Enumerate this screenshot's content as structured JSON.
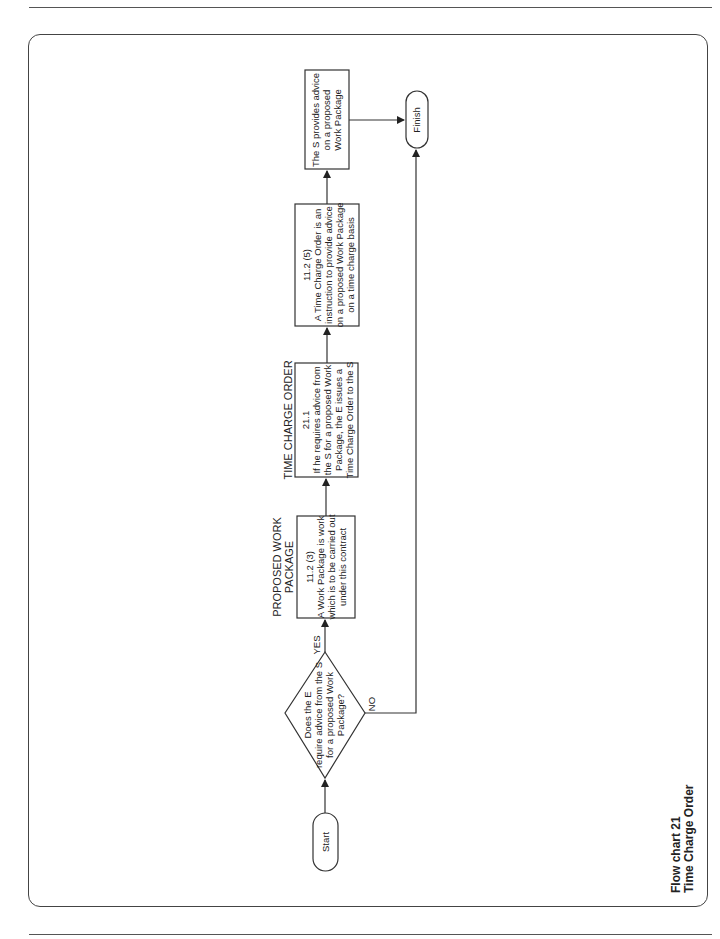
{
  "caption": {
    "line1": "Flow chart 21",
    "line2": "Time Charge Order"
  },
  "nodes": {
    "start": {
      "label": "Start"
    },
    "decision": {
      "lines": [
        "Does the E",
        "require advice from the S",
        "for a proposed Work",
        "Package?"
      ]
    },
    "yes_label": "YES",
    "no_label": "NO",
    "box1": {
      "heading": [
        "PROPOSED WORK",
        "PACKAGE"
      ],
      "lines": [
        "11.2 (3)",
        "A Work Package is work",
        "which is to be carried out",
        "under this contract"
      ]
    },
    "box2": {
      "heading": [
        "TIME CHARGE ORDER"
      ],
      "lines": [
        "21.1",
        "If he requires advice from",
        "the S for a proposed Work",
        "Package, the E issues a",
        "Time Charge Order to the S"
      ]
    },
    "box3": {
      "lines": [
        "11.2 (5)",
        "A Time Charge Order is an",
        "instruction to provide advice",
        "on a proposed Work Package",
        "on a time charge basis"
      ]
    },
    "box4": {
      "lines": [
        "The S provides advice",
        "on a proposed",
        "Work Package"
      ]
    },
    "finish": {
      "label": "Finish"
    }
  },
  "colors": {
    "stroke": "#333333",
    "background": "#ffffff"
  }
}
